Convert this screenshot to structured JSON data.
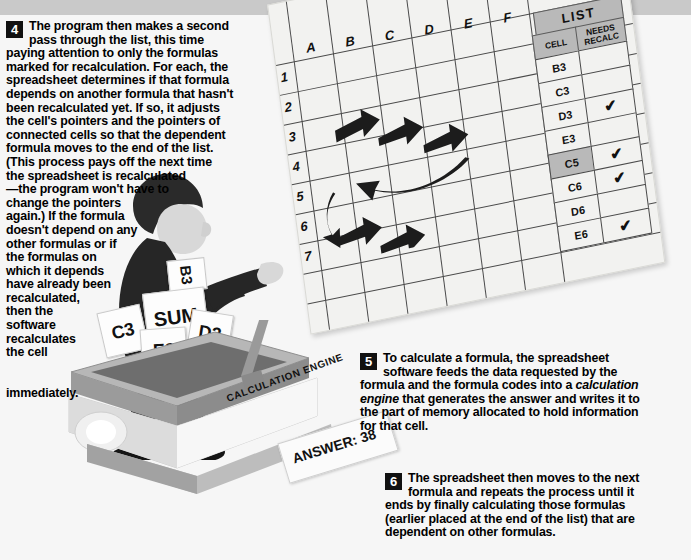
{
  "page": {
    "background_color": "#f6f6f6",
    "top_band_color": "#c9c9c9"
  },
  "steps": [
    {
      "number": "4",
      "text": "The program then makes a second pass through the list, this time paying attention to only the formulas marked for recalculation. For each, the spreadsheet determines if that formula depends on another formula that hasn't been recalculated yet. If so, it adjusts the cell's pointers and the pointers of connected cells so that the dependent formula moves to the end of the list. (This process pays off the next time the spreadsheet is recalculated—the program won't have to change the pointers again.) If the formula doesn't depend on any other formulas or if the formulas on which it depends have already been recalculated, then the software recalculates the cell immediately."
    },
    {
      "number": "5",
      "text_part1": "To calculate a formula, the spreadsheet software feeds the data requested by the formula and the formula codes into a ",
      "text_italic": "calculation engine",
      "text_part2": " that generates the answer and writes it to the part of memory allocated to hold information for that cell."
    },
    {
      "number": "6",
      "text": "The spreadsheet then moves to the next formula and repeats the process until it ends by finally calculating those formulas (earlier placed at the end of the list) that are dependent on other formulas."
    }
  ],
  "spreadsheet": {
    "column_headers": [
      "A",
      "B",
      "C",
      "D",
      "E",
      "F"
    ],
    "row_headers": [
      "1",
      "2",
      "3",
      "4",
      "5",
      "6",
      "7"
    ],
    "pointer_arrows": 6
  },
  "list_table": {
    "title": "LIST",
    "headers": [
      "CELL",
      "NEEDS RECALC"
    ],
    "header_cell": "CELL",
    "header_recalc_line1": "NEEDS",
    "header_recalc_line2": "RECALC",
    "rows": [
      {
        "cell": "B3",
        "needs_recalc": false,
        "highlighted": false
      },
      {
        "cell": "C3",
        "needs_recalc": false,
        "highlighted": false
      },
      {
        "cell": "D3",
        "needs_recalc": true,
        "highlighted": false
      },
      {
        "cell": "E3",
        "needs_recalc": false,
        "highlighted": false
      },
      {
        "cell": "C5",
        "needs_recalc": true,
        "highlighted": true
      },
      {
        "cell": "C6",
        "needs_recalc": true,
        "highlighted": false
      },
      {
        "cell": "D6",
        "needs_recalc": false,
        "highlighted": false
      },
      {
        "cell": "E6",
        "needs_recalc": true,
        "highlighted": false
      }
    ],
    "check_glyph": "✔"
  },
  "illustration": {
    "machine_label": "CALCULATION ENGINE",
    "answer_label": "ANSWER: 38",
    "cards": [
      {
        "label": "B3"
      },
      {
        "label": "SUM"
      },
      {
        "label": "C3"
      },
      {
        "label": "D3"
      },
      {
        "label": "E3"
      }
    ]
  }
}
